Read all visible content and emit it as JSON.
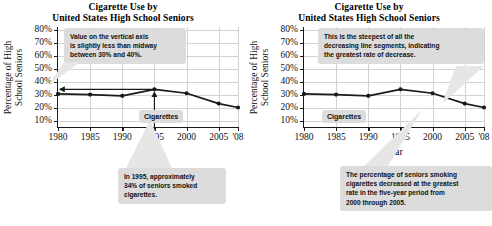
{
  "panels": [
    {
      "id": "left",
      "title_line1": "Cigarette Use by",
      "title_line2": "United States High School Seniors",
      "ylabel_line1": "Percentage of High",
      "ylabel_line2": "School Seniors",
      "xlabel": "Year",
      "series_label": "Cigarettes",
      "callouts": [
        {
          "name": "vertical-axis-reading-callout",
          "lines": [
            "Value on the vertical axis",
            "is slightly less than midway",
            "between 30% and 40%."
          ]
        },
        {
          "name": "nineteen-ninetyfive-value-callout",
          "lines": [
            "In 1995, approximately",
            "34% of seniors smoked",
            "cigarettes."
          ]
        }
      ]
    },
    {
      "id": "right",
      "title_line1": "Cigarette Use by",
      "title_line2": "United States High School Seniors",
      "ylabel_line1": "Percentage of High",
      "ylabel_line2": "School Seniors",
      "xlabel": "Year",
      "series_label": "Cigarettes",
      "callouts": [
        {
          "name": "steepest-segment-callout",
          "lines": [
            "This is the steepest of all the",
            "decreasing line segments, indicating",
            "the greatest rate of decrease."
          ]
        },
        {
          "name": "greatest-rate-of-decrease-callout",
          "lines": [
            "The percentage of seniors smoking",
            "cigarettes decreased at the greatest",
            "rate in the five-year period from",
            "2000 through 2005."
          ]
        }
      ]
    }
  ],
  "chart_data": [
    {
      "type": "line",
      "title": "Cigarette Use by United States High School Seniors",
      "xlabel": "Year",
      "ylabel": "Percentage of High School Seniors",
      "x": [
        1980,
        1985,
        1990,
        1995,
        2000,
        2005,
        2008
      ],
      "xtick_labels": [
        "1980",
        "1985",
        "1990",
        "1995",
        "2000",
        "2005",
        "'08"
      ],
      "ytick_labels": [
        "10%",
        "20%",
        "30%",
        "40%",
        "50%",
        "60%",
        "70%",
        "80%"
      ],
      "ytick_values": [
        10,
        20,
        30,
        40,
        50,
        60,
        70,
        80
      ],
      "series": [
        {
          "name": "Cigarettes",
          "values": [
            30.5,
            30.0,
            29.0,
            34.0,
            31.0,
            23.0,
            20.0
          ]
        }
      ],
      "xlim": [
        1980,
        2008
      ],
      "ylim": [
        5,
        82
      ],
      "grid": true,
      "legend_position": "inline-label",
      "annotations": [
        "Value on the vertical axis is slightly less than midway between 30% and 40%.",
        "In 1995, approximately 34% of seniors smoked cigarettes."
      ]
    },
    {
      "type": "line",
      "title": "Cigarette Use by United States High School Seniors",
      "xlabel": "Year",
      "ylabel": "Percentage of High School Seniors",
      "x": [
        1980,
        1985,
        1990,
        1995,
        2000,
        2005,
        2008
      ],
      "xtick_labels": [
        "1980",
        "1985",
        "1990",
        "1995",
        "2000",
        "2005",
        "'08"
      ],
      "ytick_labels": [
        "10%",
        "20%",
        "30%",
        "40%",
        "50%",
        "60%",
        "70%",
        "80%"
      ],
      "ytick_values": [
        10,
        20,
        30,
        40,
        50,
        60,
        70,
        80
      ],
      "series": [
        {
          "name": "Cigarettes",
          "values": [
            30.5,
            30.0,
            29.0,
            34.0,
            31.0,
            23.0,
            20.0
          ]
        }
      ],
      "xlim": [
        1980,
        2008
      ],
      "ylim": [
        5,
        82
      ],
      "grid": true,
      "legend_position": "inline-label",
      "annotations": [
        "This is the steepest of all the decreasing line segments, indicating the greatest rate of decrease.",
        "The percentage of seniors smoking cigarettes decreased at the greatest rate in the five-year period from 2000 through 2005."
      ]
    }
  ],
  "colors": {
    "line": "#1a1a1a",
    "grid": "#d2d2d2",
    "axis": "#1a1a1a",
    "callout_bg": "#dcdcdc",
    "text": "#111111"
  }
}
